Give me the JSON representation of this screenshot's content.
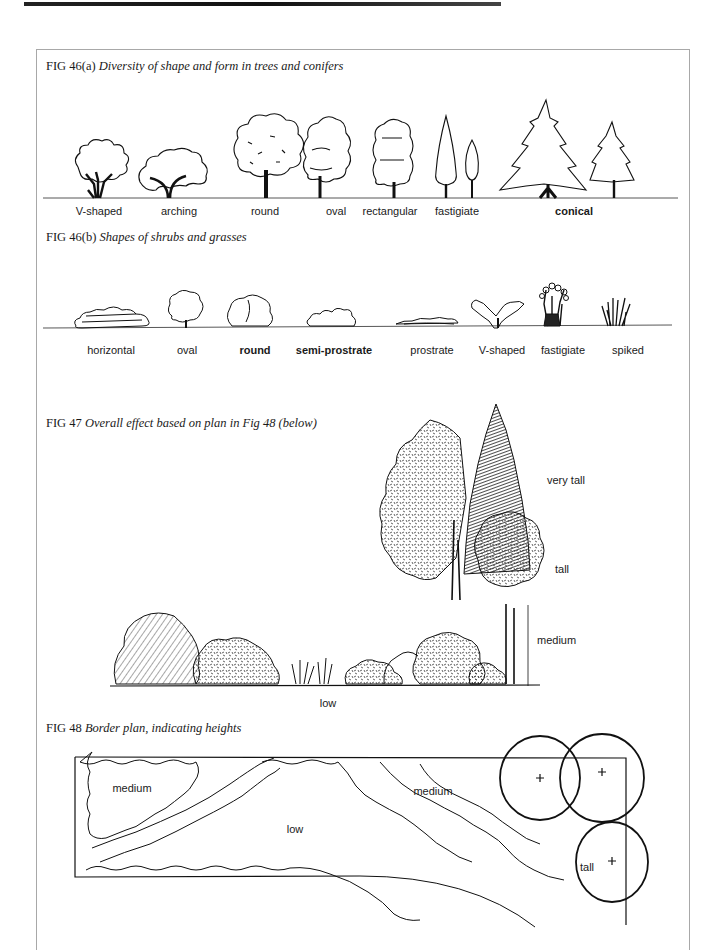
{
  "page": {
    "header_rule": true
  },
  "fig46a": {
    "number": "FIG 46(a)",
    "title": "Diversity of shape and form in trees and conifers",
    "labels": [
      "V-shaped",
      "arching",
      "round",
      "oval",
      "rectangular",
      "fastigiate",
      "conical"
    ]
  },
  "fig46b": {
    "number": "FIG 46(b)",
    "title": "Shapes of shrubs and grasses",
    "labels": [
      "horizontal",
      "oval",
      "round",
      "semi-prostrate",
      "prostrate",
      "V-shaped",
      "fastigiate",
      "spiked"
    ]
  },
  "fig47": {
    "number": "FIG 47",
    "title": "Overall effect based on plan in Fig 48 (below)",
    "height_labels": {
      "very_tall": "very tall",
      "tall": "tall",
      "medium": "medium",
      "low": "low"
    }
  },
  "fig48": {
    "number": "FIG 48",
    "title": "Border plan, indicating heights",
    "zone_labels": {
      "medium_left": "medium",
      "low": "low",
      "medium_right": "medium",
      "tall": "tall"
    }
  }
}
